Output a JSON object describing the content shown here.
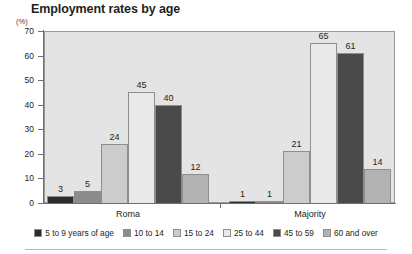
{
  "chart_data": {
    "type": "bar",
    "title": "Employment rates by age",
    "unit_label": "(%)",
    "xlabel": "",
    "ylabel": "",
    "ylim": [
      0,
      70
    ],
    "ytick_step": 10,
    "ytick_labels": [
      "70",
      "60",
      "50",
      "40",
      "30",
      "20",
      "10",
      "0"
    ],
    "grid": false,
    "legend_position": "bottom",
    "categories": [
      "Roma",
      "Majority"
    ],
    "series": [
      {
        "name": "5 to 9 years of age",
        "color": "#2b2b2b",
        "values": [
          3,
          1
        ]
      },
      {
        "name": "10 to 14",
        "color": "#8c8c8c",
        "values": [
          5,
          1
        ]
      },
      {
        "name": "15 to 24",
        "color": "#cccccc",
        "values": [
          24,
          21
        ]
      },
      {
        "name": "25 to 44",
        "color": "#e9e9e9",
        "values": [
          45,
          65
        ]
      },
      {
        "name": "45 to 59",
        "color": "#4a4a4a",
        "values": [
          40,
          61
        ]
      },
      {
        "name": "60 and over",
        "color": "#b2b2b2",
        "values": [
          12,
          14
        ]
      }
    ]
  },
  "colors": {
    "plot_background": "#e4e4e4",
    "axis": "#6f6f6f",
    "text": "#231f20",
    "bar_border": "#8e8e8e"
  }
}
